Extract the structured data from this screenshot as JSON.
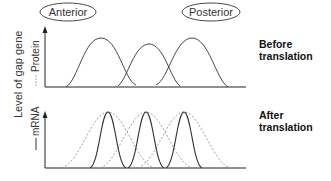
{
  "regions": {
    "anterior": "Anterior",
    "posterior": "Posterior"
  },
  "yaxis": {
    "title": "Level of gap gene",
    "legend_protein": "Protein",
    "legend_mrna": "mRNA"
  },
  "panels": [
    {
      "label_line1": "Before",
      "label_line2": "translation",
      "curves": [
        {
          "type": "solid",
          "center_x": 101,
          "peak_y": 38,
          "width": 48
        },
        {
          "type": "solid",
          "center_x": 149,
          "peak_y": 44,
          "width": 40
        },
        {
          "type": "solid",
          "center_x": 192,
          "peak_y": 38,
          "width": 48
        }
      ]
    },
    {
      "label_line1": "After",
      "label_line2": "translation",
      "curves_solid": [
        {
          "type": "solid",
          "center_x": 108,
          "peak_y": 112,
          "width": 18
        },
        {
          "type": "solid",
          "center_x": 146,
          "peak_y": 112,
          "width": 18
        },
        {
          "type": "solid",
          "center_x": 184,
          "peak_y": 112,
          "width": 18
        }
      ],
      "curves_dashed": [
        {
          "type": "dashed",
          "center_x": 108,
          "peak_y": 112,
          "width": 40
        },
        {
          "type": "dashed",
          "center_x": 146,
          "peak_y": 112,
          "width": 40
        },
        {
          "type": "dashed",
          "center_x": 184,
          "peak_y": 112,
          "width": 40
        }
      ]
    }
  ],
  "colors": {
    "axis": "#222222",
    "curve_solid": "#333333",
    "curve_dashed": "#888888"
  }
}
